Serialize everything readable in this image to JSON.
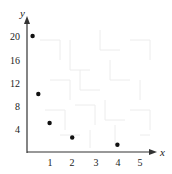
{
  "chart_data": {
    "type": "scatter",
    "title": "",
    "xlabel": "x",
    "ylabel": "y",
    "xlim": [
      0,
      5.5
    ],
    "ylim": [
      0,
      22
    ],
    "x_ticks": [
      1,
      2,
      3,
      4,
      5
    ],
    "y_ticks": [
      4,
      8,
      12,
      16,
      20
    ],
    "grid": false,
    "legend": null,
    "series": [
      {
        "name": "points",
        "x": [
          0.25,
          0.5,
          1,
          2,
          4
        ],
        "y": [
          20,
          10,
          5,
          2.5,
          1.25
        ]
      }
    ]
  },
  "axes": {
    "x_label": "x",
    "y_label": "y",
    "x_tick_labels": [
      "1",
      "2",
      "3",
      "4",
      "5"
    ],
    "y_tick_labels": [
      "4",
      "8",
      "12",
      "16",
      "20"
    ]
  },
  "colors": {
    "axis": "#333333",
    "point": "#111111",
    "background_pattern": "#ececec"
  }
}
